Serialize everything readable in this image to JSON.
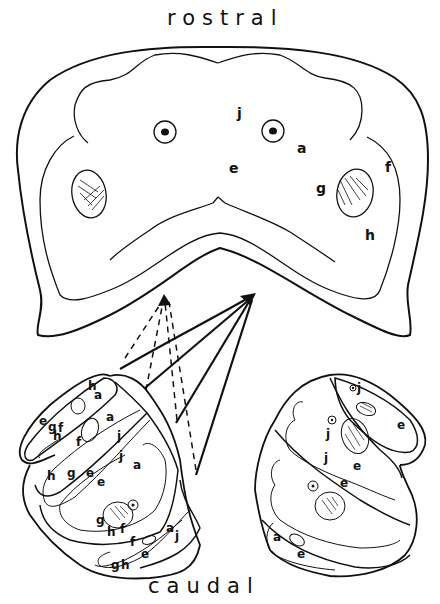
{
  "diagram": {
    "top_label": "rostral",
    "bottom_label": "caudal",
    "colors": {
      "ink": "#111111",
      "background": "#ffffff"
    },
    "rostral_section": {
      "labels": [
        {
          "id": "j",
          "text": "j",
          "x": 240,
          "y": 118
        },
        {
          "id": "a",
          "text": "a",
          "x": 300,
          "y": 153
        },
        {
          "id": "e",
          "text": "e",
          "x": 232,
          "y": 173
        },
        {
          "id": "f",
          "text": "f",
          "x": 387,
          "y": 172
        },
        {
          "id": "g",
          "text": "g",
          "x": 320,
          "y": 193
        },
        {
          "id": "h",
          "text": "h",
          "x": 369,
          "y": 240
        }
      ]
    },
    "caudal_left_stack": {
      "labels": [
        {
          "text": "h",
          "x": 88,
          "y": 390
        },
        {
          "text": "a",
          "x": 94,
          "y": 398
        },
        {
          "text": "e",
          "x": 41,
          "y": 422
        },
        {
          "text": "g",
          "x": 50,
          "y": 428
        },
        {
          "text": "f",
          "x": 59,
          "y": 430
        },
        {
          "text": "h",
          "x": 54,
          "y": 437
        },
        {
          "text": "a",
          "x": 108,
          "y": 421
        },
        {
          "text": "f",
          "x": 77,
          "y": 443
        },
        {
          "text": "j",
          "x": 118,
          "y": 438
        },
        {
          "text": "j",
          "x": 120,
          "y": 458
        },
        {
          "text": "a",
          "x": 135,
          "y": 467
        },
        {
          "text": "h",
          "x": 49,
          "y": 478
        },
        {
          "text": "g",
          "x": 69,
          "y": 475
        },
        {
          "text": "e",
          "x": 88,
          "y": 475
        },
        {
          "text": "e",
          "x": 100,
          "y": 484
        },
        {
          "text": "g",
          "x": 98,
          "y": 522
        },
        {
          "text": "h",
          "x": 109,
          "y": 536
        },
        {
          "text": "f",
          "x": 122,
          "y": 533
        },
        {
          "text": "f",
          "x": 131,
          "y": 544
        },
        {
          "text": "a",
          "x": 168,
          "y": 530
        },
        {
          "text": "j",
          "x": 175,
          "y": 538
        },
        {
          "text": "e",
          "x": 143,
          "y": 557
        },
        {
          "text": "g",
          "x": 114,
          "y": 568
        },
        {
          "text": "h",
          "x": 124,
          "y": 568
        }
      ]
    },
    "caudal_right_stack": {
      "labels": [
        {
          "text": "j",
          "x": 358,
          "y": 390
        },
        {
          "text": "e",
          "x": 399,
          "y": 427
        },
        {
          "text": "j",
          "x": 326,
          "y": 437
        },
        {
          "text": "j",
          "x": 324,
          "y": 461
        },
        {
          "text": "e",
          "x": 354,
          "y": 469
        },
        {
          "text": "e",
          "x": 341,
          "y": 485
        },
        {
          "text": "a",
          "x": 274,
          "y": 539
        },
        {
          "text": "e",
          "x": 298,
          "y": 557
        }
      ]
    },
    "arrows": {
      "solid_target": {
        "x": 255,
        "y": 295
      },
      "dashed_target": {
        "x": 164,
        "y": 297
      },
      "solid_count": 4,
      "dashed_count": 4
    }
  }
}
